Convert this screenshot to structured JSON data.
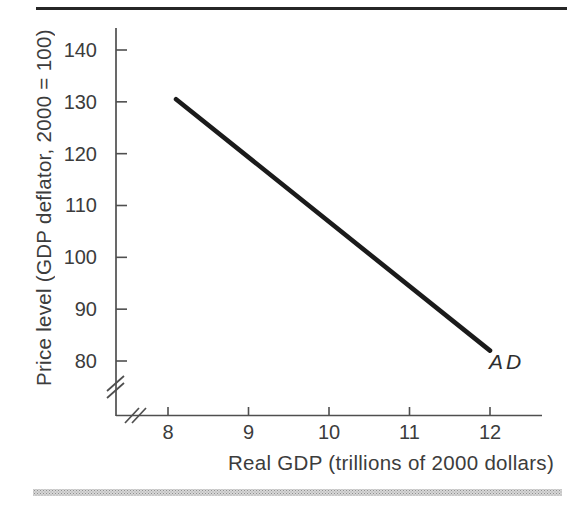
{
  "chart_data": {
    "type": "line",
    "title": "",
    "xlabel": "Real GDP (trillions of 2000 dollars)",
    "ylabel": "Price level (GDP deflator, 2000 = 100)",
    "x_ticks": [
      8,
      9,
      10,
      11,
      12
    ],
    "y_ticks": [
      140,
      130,
      120,
      110,
      100,
      90,
      80
    ],
    "xlim": [
      8,
      12.6
    ],
    "ylim": [
      75,
      143
    ],
    "grid": false,
    "axis_break_x": true,
    "axis_break_y": true,
    "legend_position": "none",
    "series": [
      {
        "name": "AD",
        "label": "AD",
        "points": [
          {
            "x": 8.1,
            "y": 130.5
          },
          {
            "x": 12.0,
            "y": 82.0
          }
        ],
        "color": "#1b1b1b"
      }
    ]
  },
  "colors": {
    "text": "#3c3c3c",
    "axis": "#4f4f4f",
    "curve": "#1b1b1b",
    "top_rule": "#262626",
    "bottom_band": "#c9c9c9"
  }
}
